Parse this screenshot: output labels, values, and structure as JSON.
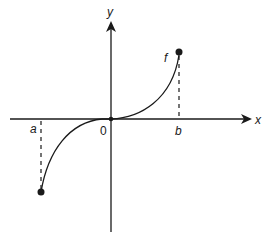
{
  "diagram": {
    "type": "function-graph",
    "axes": {
      "x_label": "x",
      "y_label": "y",
      "origin_label": "0"
    },
    "curve": {
      "label": "f",
      "description": "increasing curve through origin, concave down on left, concave up on right"
    },
    "points": {
      "a_label": "a",
      "b_label": "b"
    },
    "colors": {
      "ink": "#1a1a1a",
      "background": "#ffffff"
    }
  }
}
